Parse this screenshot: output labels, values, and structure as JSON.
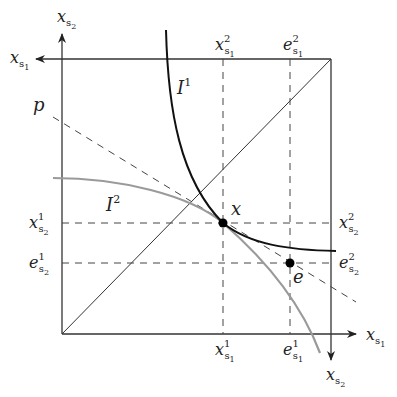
{
  "diagram": {
    "type": "Edgeworth box",
    "colors": {
      "axis": "#333333",
      "indifference_1": "#111111",
      "indifference_2": "#999999",
      "dashed": "#444444",
      "point": "#000000"
    },
    "axes": {
      "agent1_horizontal": {
        "base": "x",
        "sub": "s",
        "subsub": "1"
      },
      "agent1_vertical": {
        "base": "x",
        "sub": "s",
        "subsub": "2"
      },
      "agent2_horizontal": {
        "base": "x",
        "sub": "s",
        "subsub": "1"
      },
      "agent2_vertical": {
        "base": "x",
        "sub": "s",
        "subsub": "2"
      }
    },
    "curves": {
      "I1": {
        "base": "I",
        "sup": "1"
      },
      "I2": {
        "base": "I",
        "sup": "2"
      },
      "price_line": {
        "label": "p"
      }
    },
    "points": {
      "x": {
        "label": "x"
      },
      "e": {
        "label": "e"
      }
    },
    "tick_labels": {
      "x_s1_1": {
        "base": "x",
        "sub": "s",
        "subsub": "1",
        "sup": "1"
      },
      "e_s1_1": {
        "base": "e",
        "sub": "s",
        "subsub": "1",
        "sup": "1"
      },
      "x_s2_1": {
        "base": "x",
        "sub": "s",
        "subsub": "2",
        "sup": "1"
      },
      "e_s2_1": {
        "base": "e",
        "sub": "s",
        "subsub": "2",
        "sup": "1"
      },
      "x_s1_2": {
        "base": "x",
        "sub": "s",
        "subsub": "1",
        "sup": "2"
      },
      "e_s1_2": {
        "base": "e",
        "sub": "s",
        "subsub": "1",
        "sup": "2"
      },
      "x_s2_2": {
        "base": "x",
        "sub": "s",
        "subsub": "2",
        "sup": "2"
      },
      "e_s2_2": {
        "base": "e",
        "sub": "s",
        "subsub": "2",
        "sup": "2"
      }
    }
  }
}
